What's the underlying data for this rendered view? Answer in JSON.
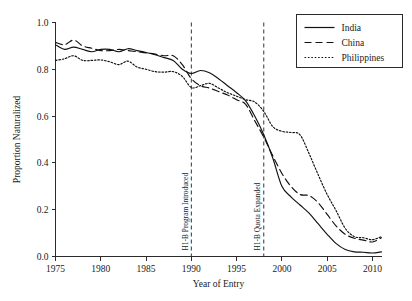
{
  "chart_data": {
    "type": "line",
    "title": "",
    "xlabel": "Year of Entry",
    "ylabel": "Proportion Naturalized",
    "xlim": [
      1975,
      2011
    ],
    "ylim": [
      0.0,
      1.0
    ],
    "grid": false,
    "legend_position": "top-right",
    "x_ticks": [
      "1975",
      "1980",
      "1985",
      "1990",
      "1995",
      "2000",
      "2005",
      "2010"
    ],
    "x_tick_values": [
      1975,
      1980,
      1985,
      1990,
      1995,
      2000,
      2005,
      2010
    ],
    "y_ticks": [
      "0.0",
      "0.2",
      "0.4",
      "0.6",
      "0.8",
      "1.0"
    ],
    "y_tick_values": [
      0.0,
      0.2,
      0.4,
      0.6,
      0.8,
      1.0
    ],
    "x": [
      1975,
      1976,
      1977,
      1978,
      1979,
      1980,
      1981,
      1982,
      1983,
      1984,
      1985,
      1986,
      1987,
      1988,
      1989,
      1990,
      1991,
      1992,
      1993,
      1994,
      1995,
      1996,
      1997,
      1998,
      1999,
      2000,
      2001,
      2002,
      2003,
      2004,
      2005,
      2006,
      2007,
      2008,
      2009,
      2010,
      2011
    ],
    "series": [
      {
        "name": "India",
        "style": "solid",
        "color": "#111111",
        "values": [
          0.905,
          0.885,
          0.895,
          0.885,
          0.875,
          0.885,
          0.885,
          0.875,
          0.888,
          0.88,
          0.872,
          0.862,
          0.85,
          0.838,
          0.8,
          0.782,
          0.795,
          0.785,
          0.76,
          0.73,
          0.7,
          0.665,
          0.6,
          0.52,
          0.42,
          0.3,
          0.255,
          0.22,
          0.185,
          0.14,
          0.095,
          0.055,
          0.03,
          0.02,
          0.018,
          0.015,
          0.02
        ]
      },
      {
        "name": "China",
        "style": "dashed",
        "color": "#111111",
        "values": [
          0.915,
          0.905,
          0.925,
          0.9,
          0.89,
          0.88,
          0.88,
          0.885,
          0.88,
          0.875,
          0.87,
          0.865,
          0.858,
          0.858,
          0.82,
          0.76,
          0.73,
          0.72,
          0.705,
          0.69,
          0.67,
          0.65,
          0.58,
          0.51,
          0.43,
          0.355,
          0.3,
          0.265,
          0.26,
          0.23,
          0.18,
          0.13,
          0.095,
          0.078,
          0.07,
          0.062,
          0.08
        ]
      },
      {
        "name": "Philippines",
        "style": "dotted",
        "color": "#111111",
        "values": [
          0.838,
          0.845,
          0.858,
          0.838,
          0.838,
          0.84,
          0.832,
          0.82,
          0.835,
          0.81,
          0.8,
          0.79,
          0.788,
          0.79,
          0.77,
          0.722,
          0.73,
          0.74,
          0.72,
          0.7,
          0.685,
          0.67,
          0.66,
          0.62,
          0.555,
          0.535,
          0.53,
          0.52,
          0.44,
          0.35,
          0.265,
          0.195,
          0.12,
          0.085,
          0.08,
          0.072,
          0.085
        ]
      }
    ],
    "annotations": [
      {
        "label": "H1-B Program Introduced",
        "x": 1990,
        "orientation": "vertical",
        "line_style": "dashed"
      },
      {
        "label": "H1-B Quota Expanded",
        "x": 1998,
        "orientation": "vertical",
        "line_style": "dashed"
      }
    ],
    "legend": [
      {
        "label": "India",
        "style": "solid"
      },
      {
        "label": "China",
        "style": "dashed"
      },
      {
        "label": "Philippines",
        "style": "dotted"
      }
    ]
  }
}
